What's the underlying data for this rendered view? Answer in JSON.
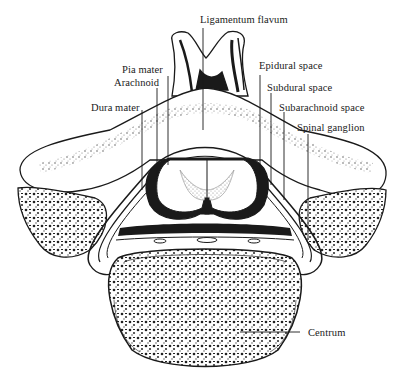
{
  "figure": {
    "labels": {
      "ligamentum_flavum": "Ligamentum flavum",
      "pia_mater": "Pia mater",
      "arachnoid": "Arachnoid",
      "dura_mater": "Dura mater",
      "epidural_space": "Epidural space",
      "subdural_space": "Subdural space",
      "subarachnoid_space": "Subarachnoid space",
      "spinal_ganglion": "Spinal ganglion",
      "centrum": "Centrum"
    },
    "colors": {
      "ink": "#1a1a1a",
      "paper": "#ffffff",
      "gray_matter": "#cfcfcf"
    }
  }
}
